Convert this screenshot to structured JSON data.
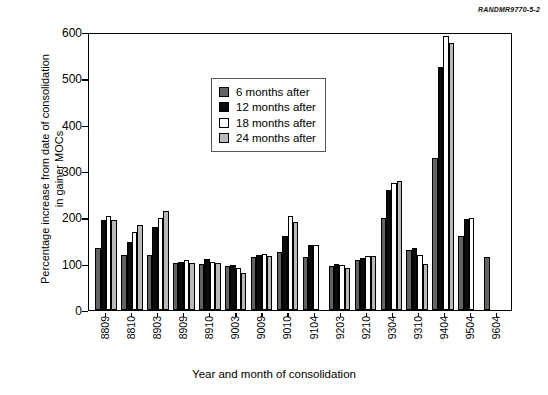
{
  "source_id": "RANDMR9770-5-2",
  "chart_data": {
    "type": "bar",
    "title": "",
    "xlabel": "Year and month of consolidation",
    "ylabel": "Percentage increase from date of consolidation in gainer MOCs",
    "ylabel_line1": "Percentage increase from date of consolidation",
    "ylabel_line2": "in gainer MOCs",
    "ylim": [
      0,
      600
    ],
    "yticks": [
      0,
      100,
      200,
      300,
      400,
      500,
      600
    ],
    "grid": false,
    "legend_position": "upper-left-inside",
    "categories": [
      "8809",
      "8810",
      "8903",
      "8909",
      "8910",
      "9003",
      "9009",
      "9010",
      "9104",
      "9203",
      "9210",
      "9304",
      "9310",
      "9404",
      "9504",
      "9604"
    ],
    "series": [
      {
        "name": "6 months after",
        "color": "#636363",
        "values": [
          135,
          120,
          120,
          102,
          100,
          95,
          115,
          125,
          115,
          95,
          108,
          200,
          130,
          330,
          160,
          115
        ]
      },
      {
        "name": "12 months after",
        "color": "#0b0b0b",
        "values": [
          195,
          148,
          180,
          105,
          110,
          98,
          120,
          160,
          140,
          100,
          112,
          260,
          135,
          527,
          198,
          null
        ]
      },
      {
        "name": "18 months after",
        "color": "#ffffff",
        "values": [
          205,
          170,
          200,
          108,
          105,
          92,
          122,
          205,
          142,
          98,
          118,
          275,
          120,
          595,
          200,
          null
        ]
      },
      {
        "name": "24 months after",
        "color": "#b9b9b9",
        "values": [
          195,
          185,
          215,
          103,
          102,
          80,
          118,
          190,
          null,
          92,
          118,
          280,
          100,
          580,
          null,
          null
        ]
      }
    ]
  },
  "legend": {
    "items": [
      {
        "label": "6 months after",
        "swatch": "#636363"
      },
      {
        "label": "12 months after",
        "swatch": "#0b0b0b"
      },
      {
        "label": "18 months after",
        "swatch": "#ffffff"
      },
      {
        "label": "24 months after",
        "swatch": "#b9b9b9"
      }
    ]
  }
}
